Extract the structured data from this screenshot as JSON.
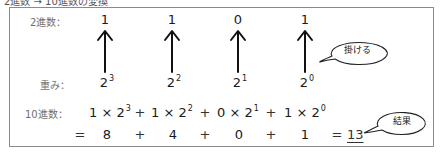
{
  "title": "2進数 → 10進数の変換",
  "rows": {
    "binary_label": "2進数：",
    "weight_label": "重み：",
    "decimal_label": "10進数："
  },
  "binary_digits": [
    "1",
    "1",
    "0",
    "1"
  ],
  "weights": [
    {
      "base": "2",
      "exp": "3"
    },
    {
      "base": "2",
      "exp": "2"
    },
    {
      "base": "2",
      "exp": "1"
    },
    {
      "base": "2",
      "exp": "0"
    }
  ],
  "expression_terms": [
    {
      "coef": "1",
      "times": "×",
      "base": "2",
      "exp": "3"
    },
    {
      "coef": "1",
      "times": "×",
      "base": "2",
      "exp": "2"
    },
    {
      "coef": "0",
      "times": "×",
      "base": "2",
      "exp": "1"
    },
    {
      "coef": "1",
      "times": "×",
      "base": "2",
      "exp": "0"
    }
  ],
  "plus": "+",
  "equals": "=",
  "values": [
    "8",
    "4",
    "0",
    "1"
  ],
  "result": "13",
  "callouts": {
    "multiply": "掛ける",
    "result": "結果"
  },
  "colors": {
    "border": "#8a8a8a",
    "text": "#1a1a1a",
    "label": "#707070"
  }
}
